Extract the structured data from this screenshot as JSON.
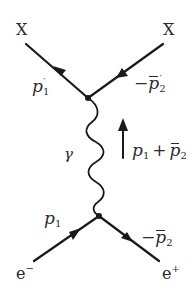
{
  "diagram": {
    "type": "feynman",
    "colors": {
      "line": "#1a1a1a",
      "text": "#2a2a2a",
      "background": "#ffffff"
    },
    "particles": {
      "top_left": "X",
      "top_right": "X",
      "bottom_left_base": "e",
      "bottom_left_charge": "−",
      "bottom_right_base": "e",
      "bottom_right_charge": "+"
    },
    "momenta": {
      "outgoing_x": {
        "sign": "",
        "base": "p",
        "sub": "1",
        "prime": "′"
      },
      "outgoing_xbar": {
        "sign": "−",
        "base": "p",
        "sub": "2",
        "prime": "′",
        "bar": true
      },
      "incoming_electron": {
        "sign": "",
        "base": "p",
        "sub": "1"
      },
      "incoming_positron": {
        "sign": "−",
        "base": "p",
        "sub": "2",
        "bar": true
      },
      "photon_sum": {
        "first": "p",
        "first_sub": "1",
        "plus": "+",
        "second": "p",
        "second_sub": "2",
        "second_bar": true
      }
    },
    "propagator": {
      "label": "γ",
      "kind": "photon"
    },
    "vertices": [
      {
        "name": "top-vertex",
        "x": 88,
        "y": 98
      },
      {
        "name": "bottom-vertex",
        "x": 99,
        "y": 216
      }
    ]
  }
}
